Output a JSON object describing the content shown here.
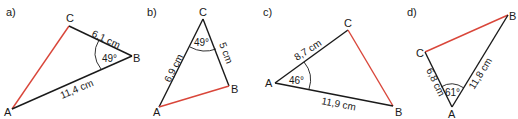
{
  "colors": {
    "edge": "#1a1a1a",
    "highlight": "#d9463a",
    "background": "#ffffff"
  },
  "triangles": [
    {
      "part": "a)",
      "vertices": {
        "A": "A",
        "B": "B",
        "C": "C"
      },
      "sides": {
        "CB": "6,1 cm",
        "AB": "11,4 cm"
      },
      "angle": {
        "at": "B",
        "value": "49°"
      },
      "highlighted_side": "AC"
    },
    {
      "part": "b)",
      "vertices": {
        "A": "A",
        "B": "B",
        "C": "C"
      },
      "sides": {
        "AC": "6,9 cm",
        "CB": "5 cm"
      },
      "angle": {
        "at": "C",
        "value": "49°"
      },
      "highlighted_side": "AB"
    },
    {
      "part": "c)",
      "vertices": {
        "A": "A",
        "B": "B",
        "C": "C"
      },
      "sides": {
        "AC": "8,7 cm",
        "AB": "11,9 cm"
      },
      "angle": {
        "at": "A",
        "value": "46°"
      },
      "highlighted_side": "CB"
    },
    {
      "part": "d)",
      "vertices": {
        "A": "A",
        "B": "B",
        "C": "C"
      },
      "sides": {
        "CA": "6,8 cm",
        "AB": "11,8 cm"
      },
      "angle": {
        "at": "A",
        "value": "61°"
      },
      "highlighted_side": "CB"
    }
  ]
}
